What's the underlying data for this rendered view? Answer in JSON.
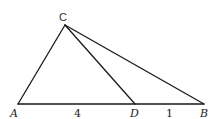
{
  "diagram": {
    "type": "triangle-with-cevian",
    "stroke_color": "#1a1a1a",
    "points": {
      "A": {
        "label": "A",
        "x": 18,
        "y": 104
      },
      "B": {
        "label": "B",
        "x": 204,
        "y": 104
      },
      "C": {
        "label": "C",
        "x": 65,
        "y": 25
      },
      "D": {
        "label": "D",
        "x": 135,
        "y": 104
      }
    },
    "segments": [
      {
        "from": "A",
        "to": "B"
      },
      {
        "from": "A",
        "to": "C"
      },
      {
        "from": "C",
        "to": "B"
      },
      {
        "from": "C",
        "to": "D"
      }
    ],
    "measures": {
      "AD": "4",
      "DB": "1"
    }
  }
}
